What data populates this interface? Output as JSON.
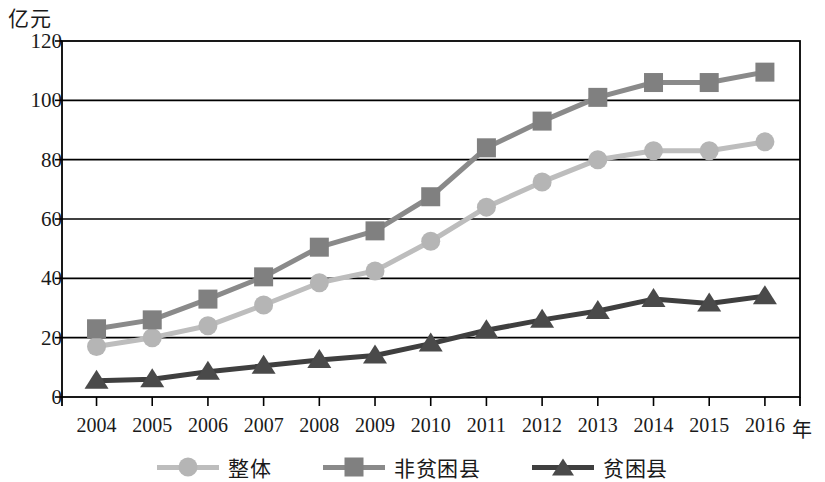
{
  "chart_data": {
    "type": "line",
    "title": "",
    "subtitle": "",
    "unit_label": "亿元",
    "xlabel": "",
    "xaxis_unit": "年",
    "ylabel": "",
    "categories": [
      "2004",
      "2005",
      "2006",
      "2007",
      "2008",
      "2009",
      "2010",
      "2011",
      "2012",
      "2013",
      "2014",
      "2015",
      "2016"
    ],
    "ylim": [
      0,
      120
    ],
    "yticks": [
      0,
      20,
      40,
      60,
      80,
      100,
      120
    ],
    "ytick_labels": [
      "0",
      "20",
      "40",
      "60",
      "80",
      "100",
      "120"
    ],
    "grid": "horizontal",
    "legend_position": "bottom",
    "series": [
      {
        "name": "整体",
        "marker": "circle",
        "color": "#b5b5b5",
        "line_color": "#bdbdbd",
        "values": [
          17,
          20,
          24,
          31,
          38.5,
          42.5,
          52.5,
          64,
          72.5,
          80,
          83,
          83,
          86
        ]
      },
      {
        "name": "非贫困县",
        "marker": "square",
        "color": "#808080",
        "line_color": "#8a8a8a",
        "values": [
          23,
          26,
          33,
          40.5,
          50.5,
          56,
          67.5,
          84,
          93,
          101,
          106,
          106,
          109.5
        ]
      },
      {
        "name": "贫困县",
        "marker": "triangle",
        "color": "#4a4a4a",
        "line_color": "#3f3f3f",
        "values": [
          5.5,
          6,
          8.5,
          10.5,
          12.5,
          14,
          18,
          22.5,
          26,
          29,
          33,
          31.5,
          34
        ]
      }
    ]
  },
  "axis": {
    "frame_color": "#000000",
    "gridline_color": "#000000"
  }
}
